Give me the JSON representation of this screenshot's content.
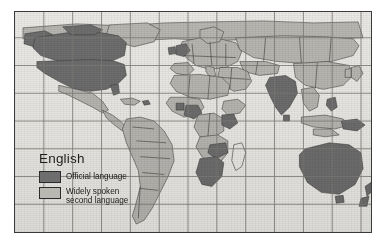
{
  "figure": {
    "kind": "world-map",
    "subject": "English",
    "background_color": "#ffffff",
    "frame_border_color": "#3a3a3a",
    "ocean_color": "#eceae6",
    "graticule_color": "#7d7b78",
    "country_border_color": "#3c3c3c"
  },
  "legend": {
    "title": "English",
    "items": [
      {
        "label": "Official language",
        "color": "#6e6e6e",
        "swatch_name": "official-language-swatch"
      },
      {
        "label": "Widely spoken\nsecond language",
        "color": "#b9b7b2",
        "swatch_name": "second-language-swatch"
      }
    ]
  },
  "map_data": {
    "projection": "cylindrical",
    "graticule": {
      "meridian_count": 12,
      "parallel_count": 7,
      "visible": true
    },
    "classes": {
      "official": "Official language",
      "second": "Widely spoken second language",
      "none": "Not highlighted"
    },
    "regions_official": [
      "United States",
      "Canada",
      "United Kingdom",
      "Ireland",
      "Australia",
      "New Zealand",
      "India",
      "South Africa",
      "Nigeria",
      "Ghana",
      "Kenya",
      "Zimbabwe",
      "Zambia",
      "Botswana",
      "Namibia",
      "Papua New Guinea",
      "Philippines",
      "Sri Lanka"
    ],
    "regions_second": [
      "Mexico",
      "Central America",
      "Brazil",
      "Argentina",
      "Colombia",
      "Peru",
      "Chile",
      "Venezuela",
      "Greenland",
      "Scandinavia",
      "Western Europe",
      "Eastern Europe",
      "Russia",
      "North Africa",
      "Sahel",
      "Central Africa",
      "Middle East",
      "Central Asia",
      "China",
      "Southeast Asia",
      "Japan",
      "Indonesia"
    ]
  }
}
